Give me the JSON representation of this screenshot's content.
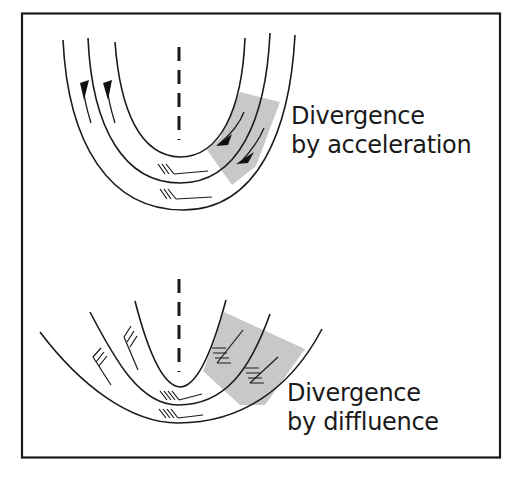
{
  "figure": {
    "border_color": "#1a1a1a",
    "background": "#ffffff",
    "shade_color": "#c8c8c8"
  },
  "panels": [
    {
      "id": "acceleration",
      "label_line1": "Divergence",
      "label_line2": "by acceleration",
      "features": [
        "trough-axis-dashed",
        "three-contours",
        "streamline-arrows",
        "shaded-divergence-region",
        "wind-barbs"
      ]
    },
    {
      "id": "diffluence",
      "label_line1": "Divergence",
      "label_line2": "by diffluence",
      "features": [
        "trough-axis-dashed",
        "three-diverging-contours",
        "shaded-divergence-region",
        "wind-barbs"
      ]
    }
  ]
}
